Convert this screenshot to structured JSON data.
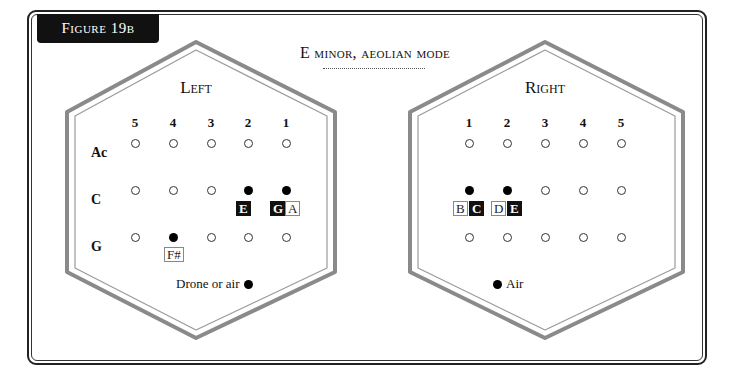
{
  "figure": {
    "badge": "Figure 19b",
    "title": "E minor, aeolian mode"
  },
  "left": {
    "label": "Left",
    "columns": [
      "5",
      "4",
      "3",
      "2",
      "1"
    ],
    "rows": [
      {
        "label": "Ac",
        "holes": [
          "open",
          "open",
          "open",
          "open",
          "open"
        ]
      },
      {
        "label": "C",
        "holes": [
          "open",
          "open",
          "open",
          "closed",
          "closed"
        ]
      },
      {
        "label": "G",
        "holes": [
          "open",
          "closed",
          "open",
          "open",
          "open"
        ]
      }
    ],
    "notes": [
      {
        "text": "E",
        "style": "filled",
        "x": 236,
        "y": 201
      },
      {
        "text": "G",
        "style": "filled",
        "x": 270,
        "y": 201
      },
      {
        "text": "A",
        "style": "outline",
        "x": 285,
        "y": 201
      },
      {
        "text": "F#",
        "style": "outline",
        "x": 164,
        "y": 247
      }
    ],
    "caption": "Drone or air"
  },
  "right": {
    "label": "Right",
    "columns": [
      "1",
      "2",
      "3",
      "4",
      "5"
    ],
    "rows": [
      {
        "label": "",
        "holes": [
          "open",
          "open",
          "open",
          "open",
          "open"
        ]
      },
      {
        "label": "",
        "holes": [
          "closed",
          "closed",
          "open",
          "open",
          "open"
        ]
      },
      {
        "label": "",
        "holes": [
          "open",
          "open",
          "open",
          "open",
          "open"
        ]
      }
    ],
    "notes": [
      {
        "text": "B",
        "style": "outline",
        "x": 453,
        "y": 201
      },
      {
        "text": "C",
        "style": "filled",
        "x": 469,
        "y": 201
      },
      {
        "text": "D",
        "style": "outline",
        "x": 491,
        "y": 201
      },
      {
        "text": "E",
        "style": "filled",
        "x": 507,
        "y": 201
      }
    ],
    "caption": "Air"
  },
  "colors": {
    "hex_stroke": "#8a8a8a",
    "frame": "#222222",
    "badge_bg": "#111111"
  }
}
